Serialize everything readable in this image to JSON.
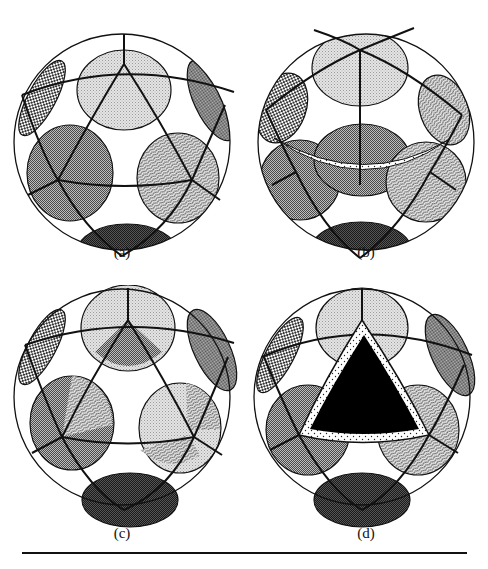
{
  "figure": {
    "panels": [
      {
        "id": "a",
        "label": "(a)",
        "variant": "base"
      },
      {
        "id": "b",
        "label": "(b)",
        "variant": "rotated-with-band"
      },
      {
        "id": "c",
        "label": "(c)",
        "variant": "recolored"
      },
      {
        "id": "d",
        "label": "(d)",
        "variant": "black-triangle"
      }
    ],
    "patterns": {
      "light": "fine-dot light gray",
      "medium": "checker medium gray",
      "dark": "dense checker dark gray",
      "wavy": "wavy hatch",
      "coarse": "coarse checker",
      "dotted-band": "sparse dots on white",
      "solid": "solid black"
    },
    "colors": {
      "outline": "#111111",
      "light": "#d8d8d8",
      "medium": "#8a8a8a",
      "dark": "#3a3a3a",
      "background": "#ffffff"
    }
  }
}
